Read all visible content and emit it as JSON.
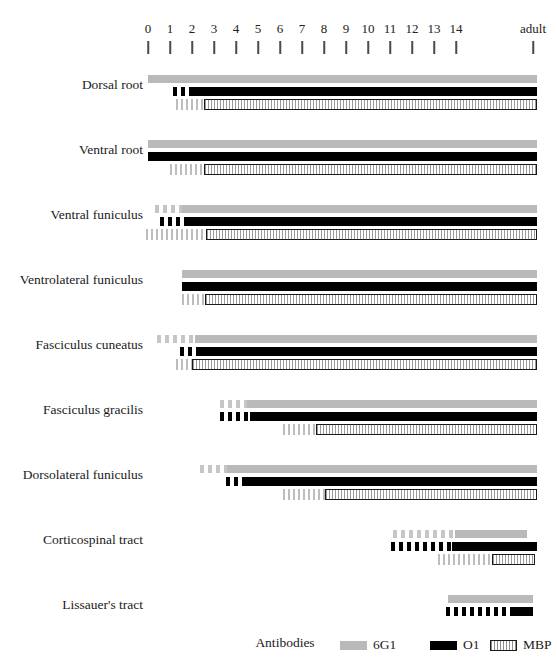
{
  "chart_data": {
    "type": "bar",
    "title": "",
    "xlabel": "",
    "ylabel": "",
    "grid": false,
    "legend_position": "bottom",
    "axis": {
      "tick_labels": [
        "0",
        "1",
        "2",
        "3",
        "4",
        "5",
        "6",
        "7",
        "8",
        "9",
        "10",
        "11",
        "12",
        "13",
        "14",
        "adult"
      ],
      "tick_x_px": [
        148,
        170,
        192,
        214,
        236,
        258,
        280,
        302,
        324,
        346,
        368,
        390,
        412,
        434,
        456,
        533
      ],
      "range_px": [
        148,
        537
      ],
      "unit": "postnatal day (0-14) then adult"
    },
    "legend": {
      "title": "Antibodies",
      "entries": [
        {
          "name": "6G1",
          "style": "solid-gray",
          "color": "#b9b9b9"
        },
        {
          "name": "O1",
          "style": "solid-black",
          "color": "#000000"
        },
        {
          "name": "MBP",
          "style": "outlined-hatched-box",
          "color": "#ffffff"
        }
      ]
    },
    "categories": [
      "Dorsal root",
      "Ventral root",
      "Ventral funiculus",
      "Ventrolateral funiculus",
      "Fasciculus cuneatus",
      "Fasciculus gracilis",
      "Dorsolateral funiculus",
      "Corticospinal tract",
      "Lissauer's tract"
    ],
    "series": [
      {
        "name": "6G1",
        "key": "g"
      },
      {
        "name": "O1",
        "key": "o"
      },
      {
        "name": "MBP",
        "key": "m"
      }
    ],
    "rows": [
      {
        "label": "Dorsal root",
        "top_px": 66,
        "bars": {
          "g": {
            "hatch_start": 148,
            "hatch_end": 148,
            "solid_start": 148,
            "end": 537
          },
          "o": {
            "hatch_start": 173,
            "hatch_end": 191,
            "solid_start": 191,
            "end": 537
          },
          "m": {
            "hatch_start": 176,
            "hatch_end": 204,
            "solid_start": 204,
            "end": 537
          }
        }
      },
      {
        "label": "Ventral root",
        "top_px": 131,
        "bars": {
          "g": {
            "hatch_start": 148,
            "hatch_end": 148,
            "solid_start": 148,
            "end": 537
          },
          "o": {
            "hatch_start": 148,
            "hatch_end": 148,
            "solid_start": 148,
            "end": 537
          },
          "m": {
            "hatch_start": 170,
            "hatch_end": 204,
            "solid_start": 204,
            "end": 537
          }
        }
      },
      {
        "label": "Ventral funiculus",
        "top_px": 196,
        "bars": {
          "g": {
            "hatch_start": 155,
            "hatch_end": 182,
            "solid_start": 182,
            "end": 537
          },
          "o": {
            "hatch_start": 160,
            "hatch_end": 186,
            "solid_start": 186,
            "end": 537
          },
          "m": {
            "hatch_start": 146,
            "hatch_end": 206,
            "solid_start": 206,
            "end": 537
          }
        }
      },
      {
        "label": "Ventrolateral funiculus",
        "top_px": 261,
        "bars": {
          "g": {
            "hatch_start": 182,
            "hatch_end": 182,
            "solid_start": 182,
            "end": 537
          },
          "o": {
            "hatch_start": 182,
            "hatch_end": 182,
            "solid_start": 182,
            "end": 537
          },
          "m": {
            "hatch_start": 182,
            "hatch_end": 205,
            "solid_start": 205,
            "end": 537
          }
        }
      },
      {
        "label": "Fasciculus cuneatus",
        "top_px": 326,
        "bars": {
          "g": {
            "hatch_start": 157,
            "hatch_end": 195,
            "solid_start": 195,
            "end": 537
          },
          "o": {
            "hatch_start": 180,
            "hatch_end": 198,
            "solid_start": 198,
            "end": 537
          },
          "m": {
            "hatch_start": 176,
            "hatch_end": 192,
            "solid_start": 192,
            "end": 537
          }
        }
      },
      {
        "label": "Fasciculus gracilis",
        "top_px": 391,
        "bars": {
          "g": {
            "hatch_start": 220,
            "hatch_end": 247,
            "solid_start": 247,
            "end": 537
          },
          "o": {
            "hatch_start": 220,
            "hatch_end": 250,
            "solid_start": 250,
            "end": 537
          },
          "m": {
            "hatch_start": 283,
            "hatch_end": 316,
            "solid_start": 316,
            "end": 537
          }
        }
      },
      {
        "label": "Dorsolateral funiculus",
        "top_px": 456,
        "bars": {
          "g": {
            "hatch_start": 200,
            "hatch_end": 227,
            "solid_start": 227,
            "end": 537
          },
          "o": {
            "hatch_start": 226,
            "hatch_end": 244,
            "solid_start": 244,
            "end": 537
          },
          "m": {
            "hatch_start": 283,
            "hatch_end": 325,
            "solid_start": 325,
            "end": 537
          }
        }
      },
      {
        "label": "Corticospinal tract",
        "top_px": 521,
        "bars": {
          "g": {
            "hatch_start": 393,
            "hatch_end": 455,
            "solid_start": 455,
            "end": 527
          },
          "o": {
            "hatch_start": 391,
            "hatch_end": 452,
            "solid_start": 452,
            "end": 537
          },
          "m": {
            "hatch_start": 438,
            "hatch_end": 492,
            "solid_start": 492,
            "end": 535
          }
        }
      },
      {
        "label": "Lissauer's tract",
        "top_px": 586,
        "bars": {
          "g": {
            "hatch_start": 448,
            "hatch_end": 448,
            "solid_start": 448,
            "end": 533
          },
          "o": {
            "hatch_start": 446,
            "hatch_end": 511,
            "solid_start": 511,
            "end": 533
          },
          "m": null
        }
      }
    ]
  }
}
